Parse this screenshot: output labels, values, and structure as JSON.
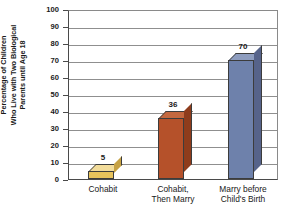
{
  "chart_data": {
    "type": "bar",
    "title": "",
    "subtitle": "",
    "xlabel": "",
    "ylabel": "Percentage of Children Who Live with Two Biological Parents until Age 18",
    "ylabel_lines": [
      "Percentage of Children",
      "Who Live with Two Biological",
      "Parents until Age 18"
    ],
    "categories": [
      "Cohabit",
      "Cohabit, Then Marry",
      "Marry before Child's Birth"
    ],
    "category_lines": [
      [
        "Cohabit"
      ],
      [
        "Cohabit,",
        "Then Marry"
      ],
      [
        "Marry before",
        "Child's Birth"
      ]
    ],
    "values": [
      5,
      36,
      70
    ],
    "value_labels": [
      "5",
      "36",
      "70"
    ],
    "ylim": [
      0,
      100
    ],
    "ytick_step": 10,
    "ytick_labels": [
      "100",
      "90",
      "80",
      "70",
      "60",
      "50",
      "40",
      "30",
      "20",
      "10",
      "0"
    ],
    "ytick_values": [
      100,
      90,
      80,
      70,
      60,
      50,
      40,
      30,
      20,
      10,
      0
    ],
    "grid": true,
    "grid_axis": "y",
    "legend": false,
    "legend_position": "none",
    "bar_colors": [
      "#E8C35B",
      "#B5512A",
      "#6E81AB"
    ],
    "bar_top_colors": [
      "#F2DC9A",
      "#C4683F",
      "#8E9DBF"
    ],
    "bar_side_colors": [
      "#C6A143",
      "#8E3C1C",
      "#56638A"
    ],
    "bar_outline_color": "#3C3C3C",
    "axis_color": "#4A4A4A",
    "grid_color": "#8F8F8F",
    "background_color": "#FFFFFF",
    "text_color": "#1A1A1A"
  }
}
